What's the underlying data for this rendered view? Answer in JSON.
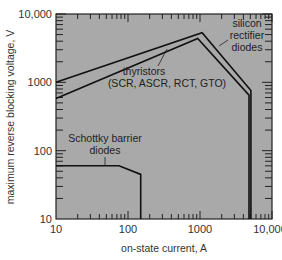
{
  "chart_data": {
    "type": "line",
    "title": "",
    "xlabel": "on-state current, A",
    "ylabel": "maximum reverse blocking voltage, V",
    "xscale": "log",
    "yscale": "log",
    "xlim": [
      10,
      10000
    ],
    "ylim": [
      10,
      10000
    ],
    "x_ticks": [
      "10",
      "100",
      "1000",
      "10,000"
    ],
    "y_ticks": [
      "10",
      "100",
      "1000",
      "10,000"
    ],
    "grid": false,
    "legend": null,
    "background": "#a9a9a9",
    "series": [
      {
        "name": "silicon rectifier diodes",
        "label_lines": [
          "silicon",
          "rectifier",
          "diodes"
        ],
        "points": [
          [
            10,
            1000
          ],
          [
            1070,
            5300
          ],
          [
            5100,
            760
          ],
          [
            5100,
            10
          ]
        ]
      },
      {
        "name": "thyristors (SCR, ASCR, RCT, GTO)",
        "label_lines": [
          "thyristors",
          "(SCR, ASCR, RCT, GTO)"
        ],
        "points": [
          [
            10,
            580
          ],
          [
            930,
            4400
          ],
          [
            4800,
            650
          ],
          [
            4800,
            10
          ]
        ]
      },
      {
        "name": "Schottky barrier diodes",
        "label_lines": [
          "Schottky barrier",
          "diodes"
        ],
        "points": [
          [
            10,
            60
          ],
          [
            75,
            60
          ],
          [
            150,
            45
          ],
          [
            150,
            10
          ]
        ]
      }
    ]
  }
}
